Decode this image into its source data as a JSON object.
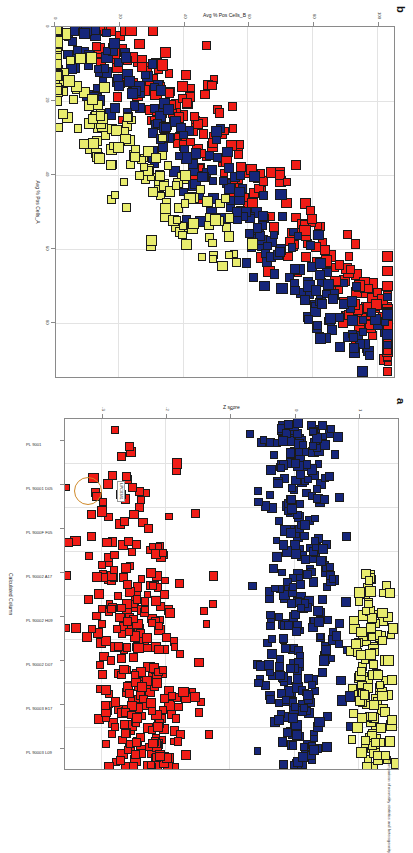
{
  "figure": {
    "orientation": "rotated-90-clockwise",
    "background": "#ffffff",
    "caption_fragment": "Comparison of normality statistics and heterogeneity"
  },
  "colors": {
    "red": "#f01c16",
    "blue": "#16267a",
    "yellow": "#e8ec6e",
    "axis": "#8a8a8a",
    "grid": "#e3e3e3",
    "annotation_circle": "#d08a2a"
  },
  "panel_a": {
    "letter": "a",
    "xlabel": "Calculated Column",
    "ylabel": "Z score",
    "xticklabels": [
      "PL 9001",
      "PL 90001 D05",
      "PL 9000F F05",
      "PL 90002 A17",
      "PL 90002 H09",
      "PL 90002 D07",
      "PL 90003 E17",
      "PL 90003 L09"
    ],
    "yticklabels": [
      "-3",
      "-2",
      "-1",
      "0",
      "1"
    ],
    "annotation": {
      "label": "LPC0341",
      "shape": "circle"
    }
  },
  "panel_b": {
    "letter": "b",
    "xlabel": "Avg % Pos Cells_A",
    "ylabel": "Avg % Pos Cells_B",
    "xticklabels": [
      "0",
      "20",
      "40",
      "60",
      "80"
    ],
    "yticklabels": [
      "0",
      "20",
      "40",
      "60",
      "80",
      "100"
    ]
  },
  "chart_data": [
    {
      "type": "scatter",
      "id": "panel_a",
      "title": "a",
      "xlabel": "Calculated Column",
      "ylabel": "Z score",
      "xticklabels": [
        "PL 9001",
        "PL 90001 D05",
        "PL 9000F F05",
        "PL 90002 A17",
        "PL 90002 H09",
        "PL 90002 D07",
        "PL 90003 E17",
        "PL 90003 L09"
      ],
      "yticklabels": [
        "-3",
        "-2",
        "-1",
        "0",
        "1"
      ],
      "ylim": [
        -3.6,
        1.6
      ],
      "grid": true,
      "legend": "none",
      "series": [
        {
          "name": "red cluster",
          "color": "#f01c16",
          "n": 300,
          "x_range": [
            0.02,
            0.47
          ],
          "y_range": [
            -3.5,
            -0.55
          ]
        },
        {
          "name": "blue cluster",
          "color": "#16267a",
          "n": 300,
          "x_range": [
            0.02,
            0.98
          ],
          "y_range": [
            -0.7,
            0.85
          ]
        },
        {
          "name": "yellow cluster",
          "color": "#e8ec6e",
          "n": 120,
          "x_range": [
            0.45,
            0.98
          ],
          "y_range": [
            0.75,
            1.55
          ]
        }
      ],
      "annotations": [
        {
          "text": "LPC0341",
          "type": "circled-point"
        }
      ]
    },
    {
      "type": "scatter",
      "id": "panel_b",
      "title": "b",
      "xlabel": "Avg % Pos Cells_A",
      "ylabel": "Avg % Pos Cells_B",
      "xticklabels": [
        "0",
        "20",
        "40",
        "60",
        "80"
      ],
      "yticklabels": [
        "0",
        "20",
        "40",
        "60",
        "80",
        "100"
      ],
      "xlim": [
        0,
        95
      ],
      "ylim": [
        0,
        105
      ],
      "grid": true,
      "legend": "none",
      "correlation": "negative",
      "series": [
        {
          "name": "red",
          "color": "#f01c16",
          "n": 260,
          "description": "upper-left high Avg % Pos Cells_B"
        },
        {
          "name": "blue",
          "color": "#16267a",
          "n": 230,
          "description": "middle diagonal band"
        },
        {
          "name": "yellow",
          "color": "#e8ec6e",
          "n": 170,
          "description": "lower-right low Avg % Pos Cells_B"
        }
      ]
    }
  ]
}
